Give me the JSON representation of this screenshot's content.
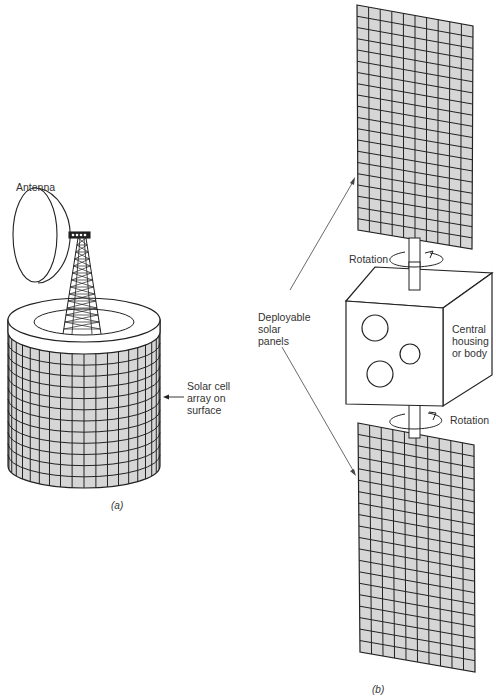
{
  "figure_a": {
    "caption": "(a)",
    "labels": {
      "antenna": "Antenna",
      "solar_array_line1": "Solar cell",
      "solar_array_line2": "array on",
      "solar_array_line3": "surface"
    }
  },
  "figure_b": {
    "caption": "(b)",
    "labels": {
      "rotation_top": "Rotation",
      "rotation_bottom": "Rotation",
      "deployable_line1": "Deployable",
      "deployable_line2": "solar",
      "deployable_line3": "panels",
      "housing_line1": "Central",
      "housing_line2": "housing",
      "housing_line3": "or body"
    },
    "panel_grid": {
      "columns": 10,
      "rows": 20
    }
  },
  "colors": {
    "cell_fill": "#d6d6d6",
    "line": "#222222",
    "background": "#ffffff"
  }
}
